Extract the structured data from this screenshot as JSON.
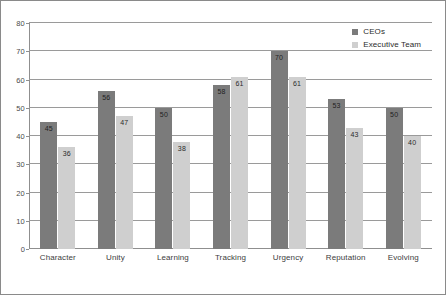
{
  "chart_data": {
    "type": "bar",
    "title": "",
    "subtitle": "",
    "xlabel": "",
    "ylabel": "",
    "ylim": [
      0,
      80
    ],
    "ytick_step": 10,
    "yticks": [
      "0",
      "10",
      "20",
      "30",
      "40",
      "50",
      "60",
      "70",
      "80"
    ],
    "grid": true,
    "grid_axis": "y",
    "legend_position": "top-right",
    "categories": [
      "Character",
      "Unity",
      "Learning",
      "Tracking",
      "Urgency",
      "Reputation",
      "Evolving"
    ],
    "series": [
      {
        "name": "CEOs",
        "color": "#7b7b7b",
        "values": [
          45,
          56,
          50,
          58,
          70,
          53,
          50
        ],
        "labels": [
          "45",
          "56",
          "50",
          "58",
          "70",
          "53",
          "50"
        ]
      },
      {
        "name": "Executive Team",
        "color": "#cfcfcf",
        "values": [
          36,
          47,
          38,
          61,
          61,
          43,
          40
        ],
        "labels": [
          "36",
          "47",
          "38",
          "61",
          "61",
          "43",
          "40"
        ]
      }
    ]
  },
  "legend": {
    "items": [
      {
        "label": "CEOs",
        "swatch": "#7b7b7b"
      },
      {
        "label": "Executive Team",
        "swatch": "#cfcfcf"
      }
    ]
  },
  "colors": {
    "series_ceos": "#7b7b7b",
    "series_executive_team": "#cfcfcf",
    "gridline": "#9a9a9a",
    "axis": "#8f8f8f",
    "border": "#8a8a8a",
    "background": "#ffffff"
  }
}
